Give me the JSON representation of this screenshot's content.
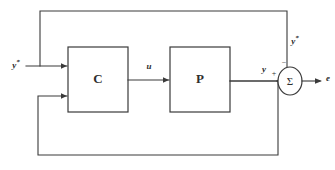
{
  "diagram": {
    "type": "control-block-diagram",
    "blocks": [
      {
        "id": "controller",
        "label": "C",
        "x": 68,
        "y": 47,
        "width": 60,
        "height": 65
      },
      {
        "id": "plant",
        "label": "P",
        "x": 170,
        "y": 47,
        "width": 60,
        "height": 65
      }
    ],
    "summing_junction": {
      "id": "sum",
      "label": "Σ",
      "cx": 290,
      "cy": 81,
      "rx": 12,
      "ry": 14,
      "top_sign": "−",
      "left_sign": "+"
    },
    "signals": [
      {
        "id": "reference-in",
        "base": "y",
        "superscript": "*",
        "x": 16,
        "y": 66
      },
      {
        "id": "control-u",
        "base": "u",
        "superscript": "",
        "x": 149,
        "y": 67
      },
      {
        "id": "plant-output-y",
        "base": "y",
        "superscript": "",
        "x": 264,
        "y": 70
      },
      {
        "id": "reference-feedback",
        "base": "y",
        "superscript": "*",
        "x": 295,
        "y": 42
      },
      {
        "id": "error-out",
        "base": "e",
        "superscript": "",
        "x": 327,
        "y": 79
      }
    ],
    "colors": {
      "line": "#3a3a3a",
      "text": "#2e2e2e",
      "background": "#ffffff"
    }
  }
}
